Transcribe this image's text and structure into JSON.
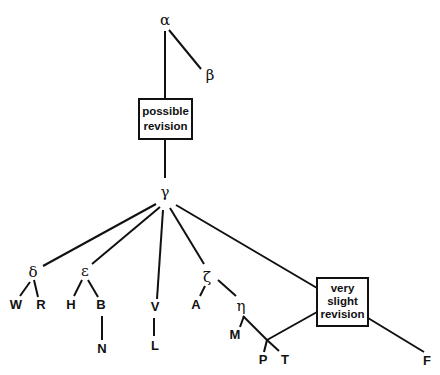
{
  "diagram": {
    "type": "stemma",
    "nodes": {
      "alpha": "α",
      "beta": "β",
      "gamma": "γ",
      "delta": "δ",
      "epsilon": "ε",
      "zeta": "ζ",
      "eta": "η",
      "possible_revision": [
        "possible",
        "revision"
      ],
      "very_slight_revision": [
        "very",
        "slight",
        "revision"
      ],
      "W": "W",
      "R": "R",
      "H": "H",
      "B": "B",
      "N": "N",
      "V": "V",
      "L": "L",
      "A": "A",
      "M": "M",
      "P": "P",
      "T": "T",
      "F": "F"
    },
    "edges": [
      [
        "α",
        "β"
      ],
      [
        "α",
        "possible revision"
      ],
      [
        "possible revision",
        "γ"
      ],
      [
        "γ",
        "δ"
      ],
      [
        "γ",
        "ε"
      ],
      [
        "γ",
        "V"
      ],
      [
        "γ",
        "ζ"
      ],
      [
        "γ",
        "very slight revision"
      ],
      [
        "δ",
        "W"
      ],
      [
        "δ",
        "R"
      ],
      [
        "ε",
        "H"
      ],
      [
        "ε",
        "B"
      ],
      [
        "B",
        "N"
      ],
      [
        "V",
        "L"
      ],
      [
        "ζ",
        "A"
      ],
      [
        "ζ",
        "η"
      ],
      [
        "η",
        "M"
      ],
      [
        "η",
        "P/T junction"
      ],
      [
        "P/T junction",
        "P"
      ],
      [
        "P/T junction",
        "T"
      ],
      [
        "P/T junction",
        "very slight revision"
      ],
      [
        "very slight revision",
        "F"
      ]
    ]
  }
}
